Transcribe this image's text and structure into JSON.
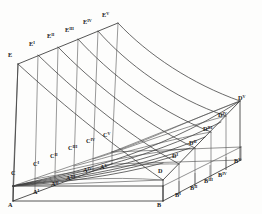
{
  "labels": {
    "top_edge": [
      {
        "name": "E",
        "base": "E",
        "prime": "",
        "x": 8,
        "y": 57
      },
      {
        "name": "E-1",
        "base": "E",
        "prime": "I",
        "x": 29,
        "y": 46
      },
      {
        "name": "E-2",
        "base": "E",
        "prime": "II",
        "x": 47,
        "y": 38
      },
      {
        "name": "E-3",
        "base": "E",
        "prime": "III",
        "x": 65,
        "y": 32
      },
      {
        "name": "E-4",
        "base": "E",
        "prime": "IV",
        "x": 83,
        "y": 24
      },
      {
        "name": "E-5",
        "base": "E",
        "prime": "V",
        "x": 102,
        "y": 17
      }
    ],
    "front_base": [
      {
        "name": "A",
        "base": "A",
        "prime": "",
        "x": 8,
        "y": 207
      },
      {
        "name": "A-1",
        "base": "A",
        "prime": "I",
        "x": 33,
        "y": 194
      },
      {
        "name": "A-2",
        "base": "A",
        "prime": "II",
        "x": 51,
        "y": 186
      },
      {
        "name": "A-3",
        "base": "A",
        "prime": "III",
        "x": 66,
        "y": 180
      },
      {
        "name": "A-4",
        "base": "A",
        "prime": "IV",
        "x": 83,
        "y": 172
      },
      {
        "name": "A-5",
        "base": "A",
        "prime": "V",
        "x": 100,
        "y": 169
      }
    ],
    "mid_base": [
      {
        "name": "C",
        "base": "C",
        "prime": "",
        "x": 11,
        "y": 175
      },
      {
        "name": "C-1",
        "base": "C",
        "prime": "I",
        "x": 33,
        "y": 166
      },
      {
        "name": "C-2",
        "base": "C",
        "prime": "II",
        "x": 50,
        "y": 158
      },
      {
        "name": "C-3",
        "base": "C",
        "prime": "III",
        "x": 68,
        "y": 150
      },
      {
        "name": "C-4",
        "base": "C",
        "prime": "IV",
        "x": 86,
        "y": 143
      },
      {
        "name": "C-5",
        "base": "C",
        "prime": "V",
        "x": 103,
        "y": 137
      }
    ],
    "right_base": [
      {
        "name": "B",
        "base": "B",
        "prime": "",
        "x": 157,
        "y": 207
      },
      {
        "name": "B-1",
        "base": "B",
        "prime": "I",
        "x": 175,
        "y": 197
      },
      {
        "name": "B-2",
        "base": "B",
        "prime": "II",
        "x": 190,
        "y": 190
      },
      {
        "name": "B-3",
        "base": "B",
        "prime": "III",
        "x": 204,
        "y": 183
      },
      {
        "name": "B-4",
        "base": "B",
        "prime": "IV",
        "x": 218,
        "y": 177
      },
      {
        "name": "B-5",
        "base": "B",
        "prime": "V",
        "x": 234,
        "y": 163
      }
    ],
    "right_upper": [
      {
        "name": "D",
        "base": "D",
        "prime": "",
        "x": 158,
        "y": 173
      },
      {
        "name": "D-1",
        "base": "D",
        "prime": "I",
        "x": 172,
        "y": 158
      },
      {
        "name": "D-2",
        "base": "D",
        "prime": "II",
        "x": 189,
        "y": 145
      },
      {
        "name": "D-3",
        "base": "D",
        "prime": "III",
        "x": 203,
        "y": 131
      },
      {
        "name": "D-4",
        "base": "D",
        "prime": "IV",
        "x": 218,
        "y": 117
      },
      {
        "name": "D-5",
        "base": "D",
        "prime": "V",
        "x": 238,
        "y": 100
      }
    ]
  },
  "geometry": {
    "base_rect": {
      "A": [
        13,
        200
      ],
      "B": [
        163,
        200
      ],
      "Bv": [
        240,
        158
      ],
      "Av": [
        90,
        158
      ]
    },
    "back_top": {
      "E": [
        18,
        63
      ],
      "Ev": [
        118,
        22
      ],
      "Dv": [
        240,
        100
      ]
    },
    "generators": 6,
    "cross_curves": 6
  },
  "style": {
    "ink": "#2b2b2b",
    "paper": "#fdfdfc",
    "curve": "#3a3a3a"
  }
}
